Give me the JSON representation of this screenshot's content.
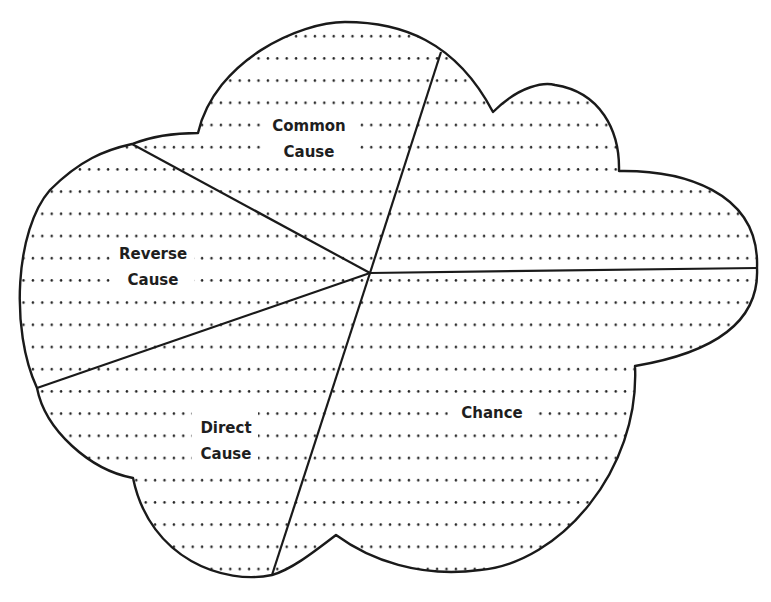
{
  "diagram": {
    "type": "cloud-pie",
    "colors": {
      "stroke": "#1a1a1a",
      "dots": "#222222",
      "background": "#ffffff",
      "text": "#1e1e1e"
    },
    "center": [
      370,
      273
    ],
    "segments": [
      {
        "id": "common-cause",
        "line1": "Common",
        "line2": "Cause"
      },
      {
        "id": "reverse-cause",
        "line1": "Reverse",
        "line2": "Cause"
      },
      {
        "id": "direct-cause",
        "line1": "Direct",
        "line2": "Cause"
      },
      {
        "id": "chance",
        "line1": "Chance",
        "line2": ""
      }
    ]
  }
}
